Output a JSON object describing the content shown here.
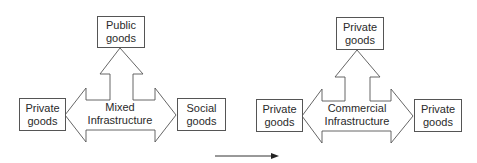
{
  "diagrams": [
    {
      "name": "mixed",
      "center_label_line1": "Mixed",
      "center_label_line2": "Infrastructure",
      "top": {
        "line1": "Public",
        "line2": "goods"
      },
      "left": {
        "line1": "Private",
        "line2": "goods"
      },
      "right": {
        "line1": "Social",
        "line2": "goods"
      }
    },
    {
      "name": "commercial",
      "center_label_line1": "Commercial",
      "center_label_line2": "Infrastructure",
      "top": {
        "line1": "Private",
        "line2": "goods"
      },
      "left": {
        "line1": "Private",
        "line2": "goods"
      },
      "right": {
        "line1": "Private",
        "line2": "goods"
      }
    }
  ],
  "transition_arrow": {
    "direction": "right"
  },
  "colors": {
    "stroke": "#555555",
    "text": "#2a2a2a",
    "background": "#ffffff"
  }
}
